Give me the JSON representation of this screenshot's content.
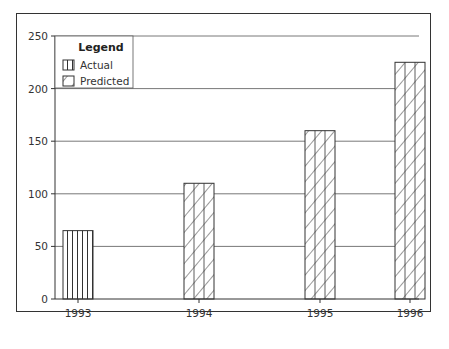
{
  "chart_data": {
    "type": "bar",
    "title": "",
    "xlabel": "",
    "ylabel": "",
    "categories": [
      "1993",
      "1994",
      "1995",
      "1996"
    ],
    "series": [
      {
        "name": "Actual",
        "pattern": "vertical-lines",
        "values": [
          65,
          null,
          null,
          null
        ]
      },
      {
        "name": "Predicted",
        "pattern": "diagonal-hatch",
        "values": [
          null,
          110,
          160,
          225
        ]
      }
    ],
    "values": [
      65,
      110,
      160,
      225
    ],
    "ylim": [
      0,
      250
    ],
    "yticks": [
      0,
      50,
      100,
      150,
      200,
      250
    ],
    "grid": true,
    "legend_position": "upper-left",
    "legend": {
      "title": "Legend",
      "entries": [
        "Actual",
        "Predicted"
      ]
    }
  },
  "colors": {
    "ink": "#333333",
    "background": "#ffffff"
  }
}
